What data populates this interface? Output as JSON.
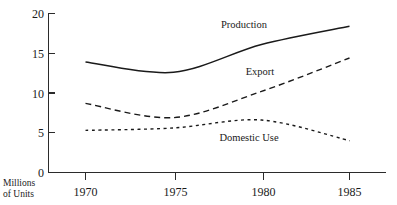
{
  "chart_data": {
    "type": "line",
    "title": "",
    "xlabel": "",
    "ylabel": "Millions of Units",
    "ylabel_line1": "Millions",
    "ylabel_line2": "of Units",
    "x": [
      1970,
      1975,
      1980,
      1985
    ],
    "xtick_labels": [
      "1970",
      "1975",
      "1980",
      "1985"
    ],
    "ytick_labels": [
      "0",
      "5",
      "10",
      "15",
      "20"
    ],
    "yticks": [
      0,
      5,
      10,
      15,
      20
    ],
    "ylim": [
      0,
      20
    ],
    "xlim": [
      1970,
      1985
    ],
    "grid": false,
    "legend_position": "inline-annotations",
    "series": [
      {
        "name": "Production",
        "label": "Production",
        "style": "solid",
        "values": [
          13.9,
          12.6,
          16.1,
          18.4
        ]
      },
      {
        "name": "Export",
        "label": "Export",
        "style": "dashed-long",
        "values": [
          8.7,
          6.9,
          10.2,
          14.4
        ]
      },
      {
        "name": "Domestic Use",
        "label": "Domestic Use",
        "style": "dashed-short",
        "values": [
          5.3,
          5.6,
          6.6,
          4.0
        ]
      }
    ],
    "annotations": [
      {
        "text": "Production",
        "x": 1979.0,
        "y": 19.2
      },
      {
        "text": "Export",
        "x": 1979.2,
        "y": 11.6
      },
      {
        "text": "Domestic Use",
        "x": 1978.0,
        "y": 4.5
      }
    ],
    "colors": {
      "ink": "#1a1a1a",
      "axis": "#2b2b2b",
      "background": "#ffffff"
    }
  }
}
